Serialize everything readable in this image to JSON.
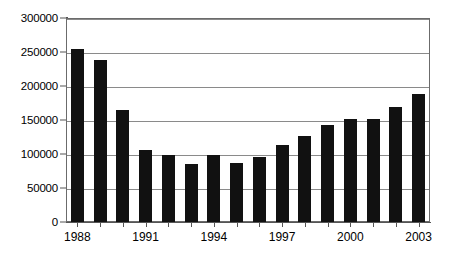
{
  "chart_data": {
    "type": "bar",
    "title": "",
    "subtitle": "",
    "xlabel": "",
    "ylabel": "",
    "categories": [
      "1988",
      "1989",
      "1990",
      "1991",
      "1992",
      "1993",
      "1994",
      "1995",
      "1996",
      "1997",
      "1998",
      "1999",
      "2000",
      "2001",
      "2002",
      "2003"
    ],
    "values": [
      254000,
      238000,
      165000,
      106000,
      98000,
      86000,
      99000,
      87000,
      96000,
      113000,
      126000,
      142000,
      151000,
      152000,
      169000,
      188000
    ],
    "ylim": [
      0,
      300000
    ],
    "yticks": [
      0,
      50000,
      100000,
      150000,
      200000,
      250000,
      300000
    ],
    "ytick_labels": [
      "0",
      "50000",
      "100000",
      "150000",
      "200000",
      "250000",
      "300000"
    ],
    "xtick_labels": [
      "1988",
      "1991",
      "1994",
      "1997",
      "2000",
      "2003"
    ],
    "xtick_label_indices": [
      0,
      3,
      6,
      9,
      12,
      15
    ],
    "grid": true,
    "grid_axis": "y",
    "legend": false,
    "legend_position": "none",
    "bar_color": "#111111",
    "grid_color": "#8a8a8a",
    "axis_color": "#555555",
    "background": "#ffffff"
  }
}
